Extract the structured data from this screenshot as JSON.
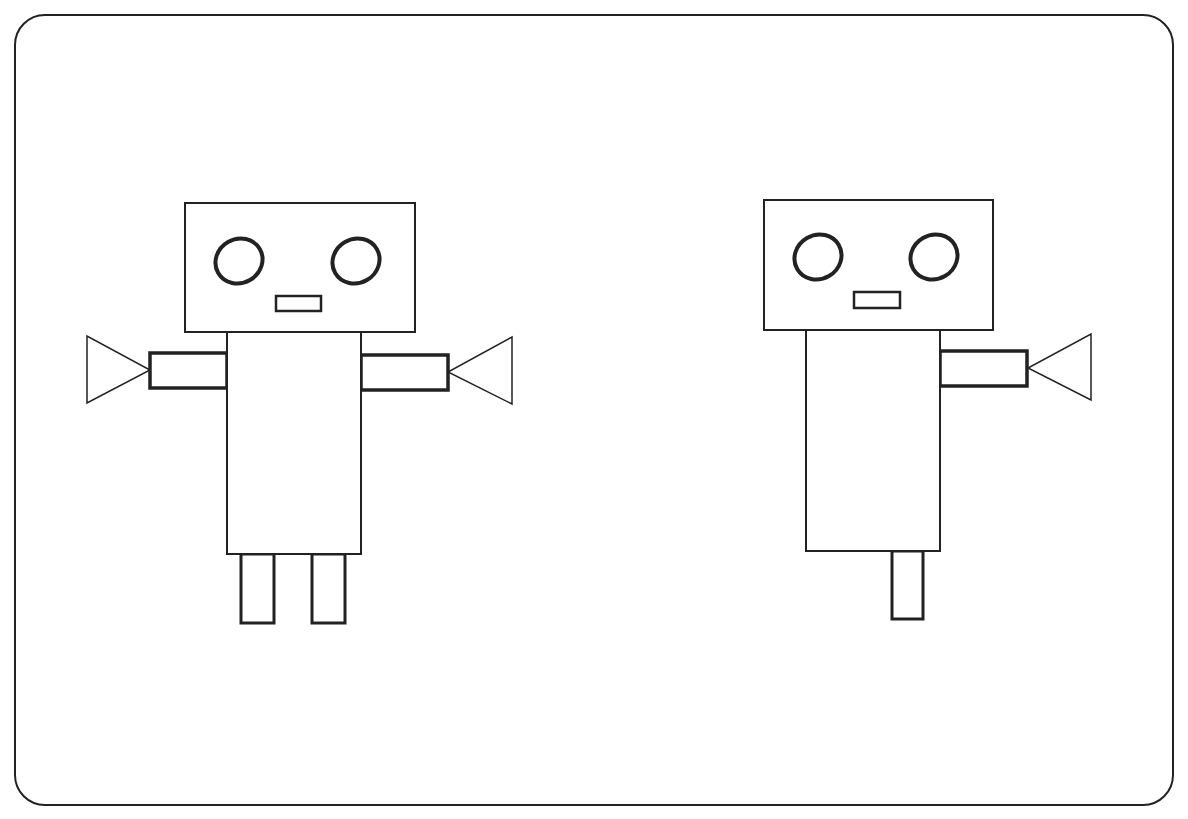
{
  "canvas": {
    "width": 1188,
    "height": 819,
    "background": "#ffffff",
    "stroke": "#222222"
  },
  "frame": {
    "x": 15,
    "y": 15,
    "width": 1158,
    "height": 790,
    "radius": 30
  },
  "robots": [
    {
      "name": "robot-left",
      "head": {
        "x": 185,
        "y": 203,
        "w": 230,
        "h": 129
      },
      "eyes": [
        {
          "cx": 239,
          "cy": 261,
          "rx": 24,
          "ry": 22
        },
        {
          "cx": 356,
          "cy": 261,
          "rx": 24,
          "ry": 22
        }
      ],
      "mouth": {
        "x": 276,
        "y": 296,
        "w": 45,
        "h": 15
      },
      "body": {
        "x": 227,
        "y": 332,
        "w": 134,
        "h": 222
      },
      "arms": [
        {
          "x": 150,
          "y": 353,
          "w": 77,
          "h": 35,
          "triangle": "87,336 87,403 150,370"
        },
        {
          "x": 361,
          "y": 355,
          "w": 87,
          "h": 35,
          "triangle": "512,337 512,404 448,372"
        }
      ],
      "legs": [
        {
          "x": 241,
          "y": 554,
          "w": 33,
          "h": 69
        },
        {
          "x": 312,
          "y": 554,
          "w": 33,
          "h": 69
        }
      ]
    },
    {
      "name": "robot-right",
      "head": {
        "x": 764,
        "y": 200,
        "w": 229,
        "h": 130
      },
      "eyes": [
        {
          "cx": 818,
          "cy": 257,
          "rx": 24,
          "ry": 22
        },
        {
          "cx": 934,
          "cy": 257,
          "rx": 24,
          "ry": 22
        }
      ],
      "mouth": {
        "x": 854,
        "y": 292,
        "w": 46,
        "h": 16
      },
      "body": {
        "x": 806,
        "y": 328,
        "w": 134,
        "h": 223
      },
      "arms": [
        {
          "x": 940,
          "y": 351,
          "w": 87,
          "h": 35,
          "triangle": "1091,334 1091,400 1028,368"
        }
      ],
      "legs": [
        {
          "x": 892,
          "y": 551,
          "w": 31,
          "h": 68
        }
      ]
    }
  ]
}
